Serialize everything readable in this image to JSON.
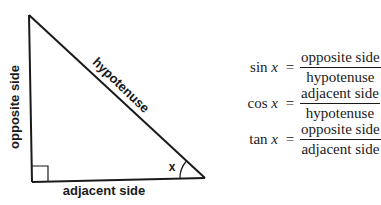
{
  "diagram": {
    "triangle": {
      "vertices": {
        "top": [
          29,
          15
        ],
        "right_angle": [
          32,
          182
        ],
        "angle_x": [
          205,
          178
        ]
      },
      "labels": {
        "opposite": "opposite side",
        "hypotenuse": "hypotenuse",
        "adjacent": "adjacent side",
        "angle": "x"
      },
      "right_angle_marker": true
    },
    "formulas": [
      {
        "function": "sin",
        "variable": "x",
        "equals": "=",
        "numerator": "opposite side",
        "denominator": "hypotenuse"
      },
      {
        "function": "cos",
        "variable": "x",
        "equals": "=",
        "numerator": "adjacent side",
        "denominator": "hypotenuse"
      },
      {
        "function": "tan",
        "variable": "x",
        "equals": "=",
        "numerator": "opposite side",
        "denominator": "adjacent side"
      }
    ],
    "colors": {
      "stroke": "#1a1a1a",
      "background": "#ffffff"
    }
  }
}
